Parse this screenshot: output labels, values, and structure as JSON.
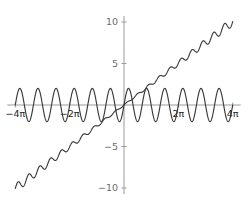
{
  "chart_data": {
    "type": "line",
    "title": "",
    "subtitle": "",
    "xlabel": "",
    "ylabel": "",
    "xlim": [
      -12.566370614359172,
      12.566370614359172
    ],
    "ylim": [
      -10,
      10
    ],
    "grid": false,
    "legend": null,
    "background_color": "#ffffff",
    "axis_color": "#9a9a9a",
    "curve_color": "#3a3a3a",
    "x_ticks": [
      {
        "value": -12.566370614359172,
        "label": "−4π"
      },
      {
        "value": -6.283185307179586,
        "label": "−2π"
      },
      {
        "value": 6.283185307179586,
        "label": "2π"
      },
      {
        "value": 12.566370614359172,
        "label": "4π"
      }
    ],
    "y_ticks": [
      {
        "value": 10,
        "label": "10"
      },
      {
        "value": 5,
        "label": "5"
      },
      {
        "value": -5,
        "label": "−5"
      },
      {
        "value": -10,
        "label": "−10"
      }
    ],
    "series": [
      {
        "name": "oscillation",
        "expression": "2*sin(3x)",
        "amplitude": 2,
        "frequency": 3,
        "description": "constant amplitude oscillation about y = 0",
        "color": "#3a3a3a"
      },
      {
        "name": "ramp-with-ripple",
        "expression": "0.8x + 0.55*sin(5x)",
        "slope": 0.8,
        "ripple_amplitude": 0.55,
        "ripple_frequency": 5,
        "description": "rising line with growing ripple from -10 to 10",
        "color": "#3a3a3a"
      }
    ]
  }
}
